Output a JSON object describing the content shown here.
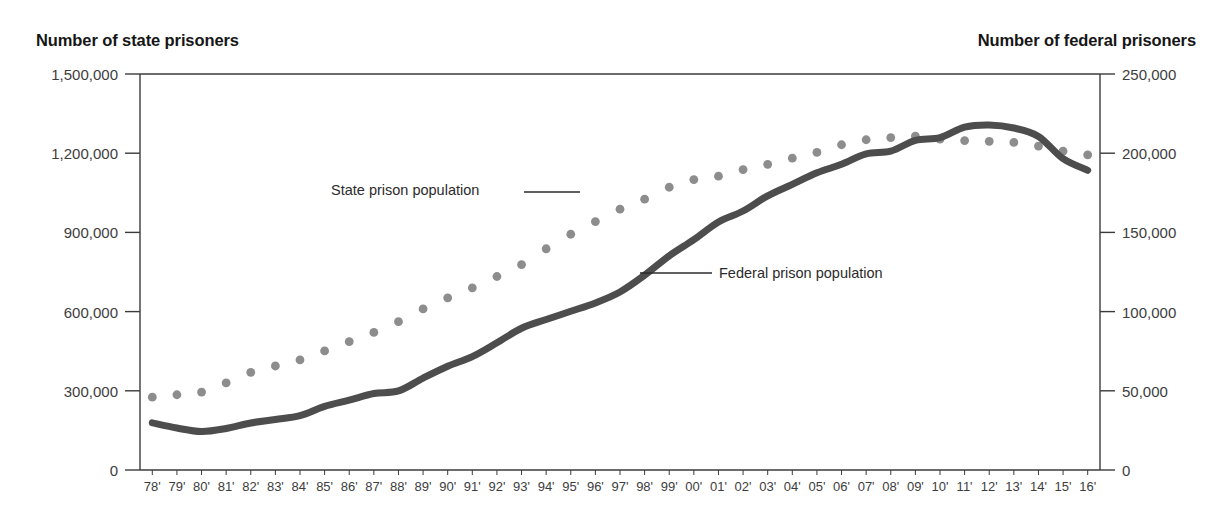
{
  "axis_titles": {
    "left": "Number of state prisoners",
    "right": "Number of federal prisoners"
  },
  "annotations": {
    "state": "State prison population",
    "federal": "Federal prison population"
  },
  "colors": {
    "state_series": "#8d8d8d",
    "federal_series": "#4d4d4d",
    "axis": "#3b3b3b",
    "text": "#1a1a1a",
    "background": "#ffffff"
  },
  "chart_data": {
    "type": "line",
    "title": "",
    "xlabel": "",
    "ylabel": "Number of state prisoners",
    "y2label": "Number of federal prisoners",
    "grid": false,
    "legend_position": "inline-annotations",
    "ylim": [
      0,
      1500000
    ],
    "y2lim": [
      0,
      250000
    ],
    "yticks": [
      "0",
      "300,000",
      "600,000",
      "900,000",
      "1,200,000",
      "1,500,000"
    ],
    "ytick_values": [
      0,
      300000,
      600000,
      900000,
      1200000,
      1500000
    ],
    "y2ticks": [
      "0",
      "50,000",
      "100,000",
      "150,000",
      "200,000",
      "250,000"
    ],
    "y2tick_values": [
      0,
      50000,
      100000,
      150000,
      200000,
      250000
    ],
    "categories": [
      "78'",
      "79'",
      "80'",
      "81'",
      "82'",
      "83'",
      "84'",
      "85'",
      "86'",
      "87'",
      "88'",
      "89'",
      "90'",
      "91'",
      "92'",
      "93'",
      "94'",
      "95'",
      "96'",
      "97'",
      "98'",
      "99'",
      "00'",
      "01'",
      "02'",
      "03'",
      "04'",
      "05'",
      "06'",
      "07'",
      "08'",
      "09'",
      "10'",
      "11'",
      "12'",
      "13'",
      "14'",
      "15'",
      "16'"
    ],
    "x_years": [
      1978,
      1979,
      1980,
      1981,
      1982,
      1983,
      1984,
      1985,
      1986,
      1987,
      1988,
      1989,
      1990,
      1991,
      1992,
      1993,
      1994,
      1995,
      1996,
      1997,
      1998,
      1999,
      2000,
      2001,
      2002,
      2003,
      2004,
      2005,
      2006,
      2007,
      2008,
      2009,
      2010,
      2011,
      2012,
      2013,
      2014,
      2015,
      2016
    ],
    "series": [
      {
        "name": "State prison population",
        "axis": "left",
        "style": "dotted",
        "color": "#8d8d8d",
        "values": [
          276000,
          285000,
          295000,
          330000,
          370000,
          394000,
          417000,
          451000,
          486000,
          521000,
          562000,
          610000,
          652000,
          690000,
          733000,
          778000,
          838000,
          893000,
          941000,
          988000,
          1026000,
          1071000,
          1100000,
          1113000,
          1138000,
          1158000,
          1181000,
          1203000,
          1232000,
          1251000,
          1259000,
          1265000,
          1253000,
          1248000,
          1245000,
          1241000,
          1227000,
          1208000,
          1194000
        ]
      },
      {
        "name": "Federal prison population",
        "axis": "right",
        "style": "solid",
        "color": "#4d4d4d",
        "values": [
          29800,
          26500,
          24300,
          26200,
          29700,
          31900,
          34300,
          40200,
          44100,
          48300,
          49900,
          58000,
          65500,
          71600,
          80300,
          89500,
          95000,
          100200,
          105500,
          112400,
          123000,
          135200,
          145400,
          156600,
          163500,
          173100,
          180300,
          187600,
          193000,
          199600,
          201300,
          208100,
          209800,
          216400,
          217800,
          215900,
          210600,
          196500,
          189200
        ]
      }
    ]
  }
}
